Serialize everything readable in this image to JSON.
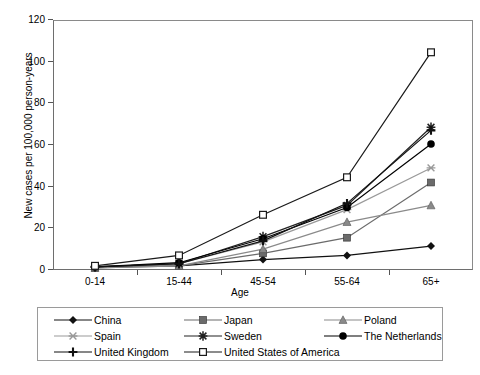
{
  "chart_data": {
    "type": "line",
    "title": "",
    "xlabel": "Age",
    "ylabel": "New cases per 100,000 person-years",
    "categories": [
      "0-14",
      "15-44",
      "45-54",
      "55-64",
      "65+"
    ],
    "ylim": [
      0,
      120
    ],
    "ytick_labels": [
      "0",
      "20",
      "40",
      "60",
      "80",
      "100",
      "120"
    ],
    "yticks": [
      0,
      20,
      40,
      60,
      80,
      100,
      120
    ],
    "grid": false,
    "legend_position": "bottom",
    "series": [
      {
        "name": "China",
        "marker": "diamond",
        "color": "#111111",
        "values": [
          1.5,
          2.0,
          5.0,
          7.0,
          11.5
        ]
      },
      {
        "name": "Japan",
        "marker": "square",
        "color": "#6b6b6b",
        "values": [
          1.0,
          2.0,
          8.0,
          15.5,
          42.0
        ]
      },
      {
        "name": "Poland",
        "marker": "triangle",
        "color": "#8a8a8a",
        "values": [
          1.0,
          2.0,
          10.0,
          23.0,
          31.0
        ]
      },
      {
        "name": "Spain",
        "marker": "x-star",
        "color": "#9a9a9a",
        "values": [
          1.5,
          3.0,
          13.5,
          29.0,
          49.0
        ]
      },
      {
        "name": "Sweden",
        "marker": "asterisk",
        "color": "#222222",
        "values": [
          1.5,
          3.0,
          16.0,
          31.0,
          68.5
        ]
      },
      {
        "name": "The Netherlands",
        "marker": "circle",
        "color": "#000000",
        "values": [
          1.5,
          3.5,
          15.0,
          30.0,
          60.5
        ]
      },
      {
        "name": "United Kingdom",
        "marker": "plus",
        "color": "#111111",
        "values": [
          1.5,
          3.0,
          14.0,
          32.0,
          67.0
        ]
      },
      {
        "name": "United States of America",
        "marker": "open-square",
        "color": "#1a1a1a",
        "values": [
          2.0,
          7.0,
          26.5,
          44.5,
          104.5
        ]
      }
    ]
  },
  "legend": {
    "rows": [
      [
        "China",
        "Japan",
        "Poland"
      ],
      [
        "Spain",
        "Sweden",
        "The Netherlands"
      ],
      [
        "United Kingdom",
        "United States of America",
        ""
      ]
    ]
  }
}
